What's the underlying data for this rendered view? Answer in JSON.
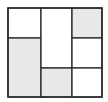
{
  "diagram": {
    "title": "",
    "colors": {
      "background": "#ffffff",
      "stroke": "#2a2a2a",
      "shaded": "#e8e8e8",
      "unshaded": "#ffffff"
    },
    "outer": {
      "x": 8,
      "y": 8,
      "width": 94,
      "height": 89
    },
    "regions": [
      {
        "id": "left-top",
        "x": 8,
        "y": 8,
        "width": 33,
        "height": 30,
        "shaded": false
      },
      {
        "id": "left-bottom",
        "x": 8,
        "y": 38,
        "width": 33,
        "height": 59,
        "shaded": true
      },
      {
        "id": "middle-top",
        "x": 41,
        "y": 8,
        "width": 31,
        "height": 60,
        "shaded": false
      },
      {
        "id": "middle-bottom",
        "x": 41,
        "y": 68,
        "width": 31,
        "height": 29,
        "shaded": true
      },
      {
        "id": "right-top",
        "x": 72,
        "y": 8,
        "width": 30,
        "height": 30,
        "shaded": true
      },
      {
        "id": "right-middle",
        "x": 72,
        "y": 38,
        "width": 30,
        "height": 30,
        "shaded": false
      },
      {
        "id": "right-bottom",
        "x": 72,
        "y": 68,
        "width": 30,
        "height": 29,
        "shaded": false
      }
    ]
  }
}
